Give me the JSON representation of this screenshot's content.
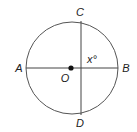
{
  "diagram": {
    "type": "circle-geometry",
    "labels": {
      "A": "A",
      "B": "B",
      "C": "C",
      "D": "D",
      "O": "O",
      "angle": "x°"
    }
  }
}
